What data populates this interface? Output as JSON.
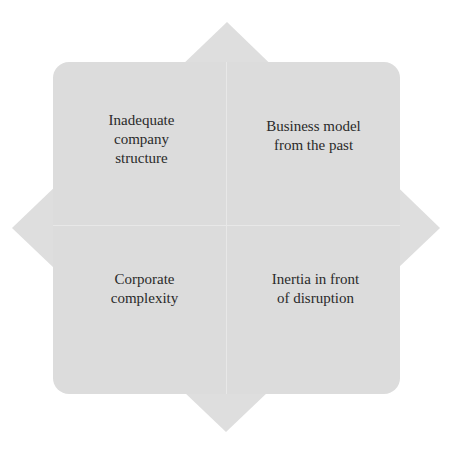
{
  "diagram": {
    "type": "four-quadrant star",
    "fill_color": "#dcdcdc",
    "text_color": "#2a2a2a",
    "quadrants": [
      {
        "position": "top-left",
        "label": "Inadequate\ncompany\nstructure"
      },
      {
        "position": "top-right",
        "label": "Business model\nfrom the past"
      },
      {
        "position": "bottom-left",
        "label": "Corporate\ncomplexity"
      },
      {
        "position": "bottom-right",
        "label": "Inertia in front\nof disruption"
      }
    ]
  }
}
